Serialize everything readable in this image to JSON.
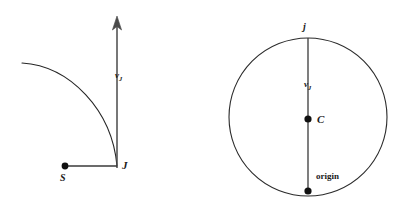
{
  "figure": {
    "background_color": "#ffffff",
    "stroke_color": "#262626",
    "width": 403,
    "height": 215
  },
  "left_panel": {
    "name": "trajectory-panel",
    "labels": {
      "arrival_point": "J",
      "departure_point": "S",
      "velocity_symbol": "v",
      "velocity_subscript": "J"
    },
    "curve": {
      "start": [
        22,
        63
      ],
      "end": [
        117,
        166
      ],
      "control_1": [
        70,
        66
      ],
      "control_2": [
        112,
        110
      ]
    },
    "velocity_arrow": {
      "x": 117,
      "y_top": 17,
      "y_bottom": 168,
      "arrowhead_half_width": 4.5,
      "arrowhead_height": 12
    },
    "baseline": {
      "x_start": 65,
      "x_end": 117,
      "y": 166
    },
    "point_s": {
      "x": 65,
      "y": 166,
      "r": 3.4
    }
  },
  "right_panel": {
    "name": "circle-panel",
    "labels": {
      "top_point": "j",
      "center_point": "C",
      "origin_point": "origin",
      "velocity_symbol": "v",
      "velocity_subscript": "J"
    },
    "circle": {
      "cx": 308,
      "cy": 117,
      "r": 79
    },
    "radius_line": {
      "x": 308,
      "y_top": 38,
      "y_bottom": 191
    },
    "point_center": {
      "x": 308,
      "y": 119,
      "r": 3.6
    },
    "point_origin": {
      "x": 308,
      "y": 191,
      "r": 3.6
    }
  }
}
